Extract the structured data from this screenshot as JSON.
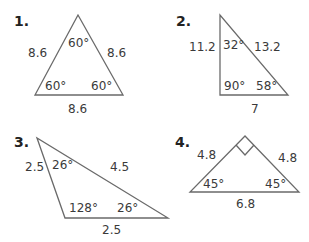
{
  "problems": [
    {
      "number": "1.",
      "type": "equilateral",
      "sides": {
        "left": "8.6",
        "right": "8.6",
        "bottom": "8.6"
      },
      "angles": {
        "top": "60°",
        "bottom_left": "60°",
        "bottom_right": "60°"
      }
    },
    {
      "number": "2.",
      "type": "right",
      "sides": {
        "left": "11.2",
        "hypotenuse": "13.2",
        "bottom": "7"
      },
      "angles": {
        "top": "32°",
        "bottom_left": "90°",
        "bottom_right": "58°"
      }
    },
    {
      "number": "3.",
      "type": "obtuse-isosceles",
      "sides": {
        "left": "2.5",
        "top": "4.5",
        "bottom": "2.5"
      },
      "angles": {
        "top": "26°",
        "bottom_left": "128°",
        "bottom_right": "26°"
      }
    },
    {
      "number": "4.",
      "type": "right-isosceles",
      "sides": {
        "left": "4.8",
        "right": "4.8",
        "bottom": "6.8"
      },
      "angles": {
        "top": "right-angle-mark",
        "bottom_left": "45°",
        "bottom_right": "45°"
      }
    }
  ],
  "colors": {
    "stroke": "#6a6a6a",
    "text": "#3a3a3a"
  }
}
